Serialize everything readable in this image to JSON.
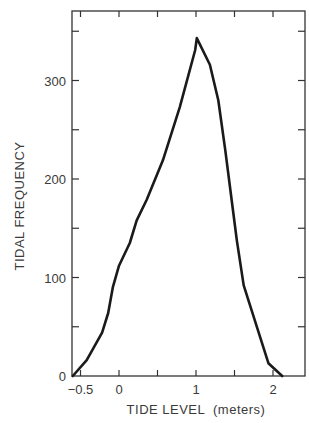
{
  "chart_data": {
    "type": "line",
    "title": "",
    "xlabel": "TIDE LEVEL  (meters)",
    "ylabel": "TIDAL FREQUENCY",
    "xlim": [
      -0.6,
      2.4
    ],
    "ylim": [
      0,
      370
    ],
    "grid": false,
    "legend": null,
    "x_ticks": [
      -0.5,
      0,
      0.5,
      1,
      1.5,
      2
    ],
    "x_tick_labels": [
      "−0.5",
      "0",
      "",
      "1",
      "",
      "2"
    ],
    "y_ticks": [
      0,
      50,
      100,
      150,
      200,
      250,
      300,
      350
    ],
    "y_tick_labels": [
      "0",
      "",
      "100",
      "",
      "200",
      "",
      "300",
      ""
    ],
    "series": [
      {
        "name": "Tidal frequency",
        "x": [
          -0.6,
          -0.42,
          -0.22,
          -0.14,
          -0.08,
          0.0,
          0.14,
          0.23,
          0.36,
          0.57,
          0.79,
          0.99,
          1.01,
          1.18,
          1.29,
          1.38,
          1.48,
          1.53,
          1.62,
          1.94,
          2.12
        ],
        "y": [
          0,
          16,
          44,
          64,
          90,
          112,
          135,
          158,
          179,
          219,
          273,
          331,
          343,
          316,
          280,
          229,
          168,
          138,
          92,
          13,
          0
        ]
      }
    ]
  }
}
